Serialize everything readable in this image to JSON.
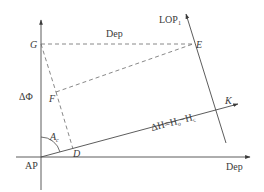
{
  "diagram": {
    "type": "navigation-intercept-method",
    "colors": {
      "line": "#4a4a4a",
      "dashed": "#6a6a6a",
      "text": "#3a3a3a",
      "background": "#ffffff"
    },
    "axes": {
      "vertical_label": "ΔΦ",
      "horizontal_label": "Dep",
      "origin_label": "AP"
    },
    "points": {
      "G": "G",
      "E": "E",
      "F": "F",
      "D": "D",
      "K": "K"
    },
    "labels": {
      "top_dep": "Dep",
      "lop": "LOP",
      "lop_sub": "1",
      "angle": "A",
      "angle_sub": "c",
      "delta_h_main": "ΔH=H",
      "delta_h_sub1": "o",
      "delta_h_mid": "−H",
      "delta_h_sub2": "c"
    }
  }
}
